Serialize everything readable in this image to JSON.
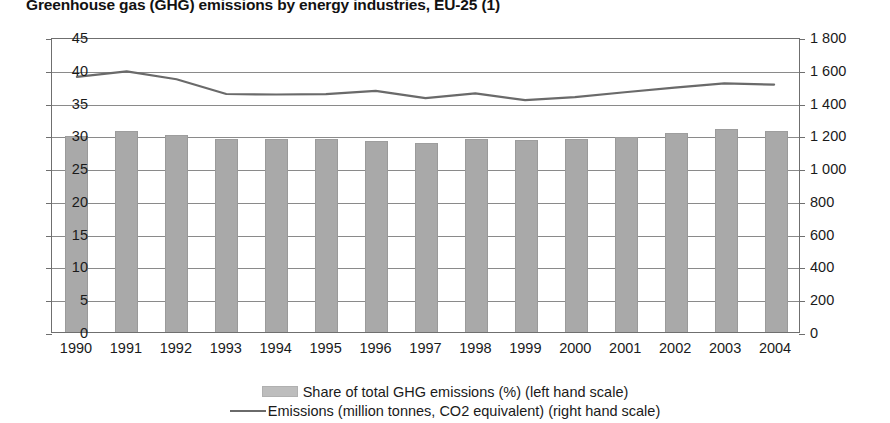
{
  "chart_data": {
    "type": "bar",
    "title": "Greenhouse gas (GHG) emissions by energy industries, EU-25 (1)",
    "xlabel": "",
    "ylabel": "",
    "categories": [
      "1990",
      "1991",
      "1992",
      "1993",
      "1994",
      "1995",
      "1996",
      "1997",
      "1998",
      "1999",
      "2000",
      "2001",
      "2002",
      "2003",
      "2004"
    ],
    "grid": true,
    "legend_position": "bottom",
    "axes": {
      "left": {
        "label": "Share of total GHG emissions (%)",
        "min": 0,
        "max": 45,
        "tick_step": 5,
        "ticks": [
          "0",
          "5",
          "10",
          "15",
          "20",
          "25",
          "30",
          "35",
          "40",
          "45"
        ]
      },
      "right": {
        "label": "Emissions (million tonnes, CO2 equivalent)",
        "min": 0,
        "max": 1800,
        "tick_step": 200,
        "ticks": [
          "0",
          "200",
          "400",
          "600",
          "800",
          "1 000",
          "1 200",
          "1 400",
          "1 600",
          "1 800"
        ]
      }
    },
    "series": [
      {
        "name": "Share of total GHG emissions (%) (left hand scale)",
        "type": "bar",
        "axis": "left",
        "color": "#a9a9a9",
        "values": [
          29.9,
          30.6,
          30.1,
          29.4,
          29.4,
          29.4,
          29.2,
          28.8,
          29.5,
          29.3,
          29.5,
          29.7,
          30.3,
          30.9,
          30.6
        ]
      },
      {
        "name": "Emissions (million tonnes, CO2 equivalent) (right hand scale)",
        "type": "line",
        "axis": "right",
        "color": "#6a6a6a",
        "values": [
          1567,
          1601,
          1553,
          1462,
          1459,
          1461,
          1481,
          1437,
          1466,
          1424,
          1443,
          1473,
          1501,
          1527,
          1520
        ]
      }
    ]
  },
  "legend": {
    "items": [
      {
        "marker": "bar-swatch",
        "label": "Share of total GHG emissions (%) (left hand scale)"
      },
      {
        "marker": "line-swatch",
        "label": "Emissions (million tonnes, CO2 equivalent) (right hand scale)"
      }
    ]
  }
}
